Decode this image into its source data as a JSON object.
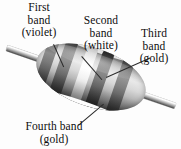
{
  "figure": {
    "background_color": "#fdfdfd",
    "text_color": "#0d0d0d"
  },
  "labels": {
    "first": {
      "line1": "First",
      "line2": "band",
      "line3": "(violet)"
    },
    "second": {
      "line1": "Second",
      "line2": "band",
      "line3": "(white)"
    },
    "third": {
      "line1": "Third",
      "line2": "band",
      "line3": "(gold)"
    },
    "fourth": {
      "line1": "Fourth band",
      "line2": "(gold)"
    }
  },
  "resistor": {
    "body_color": "#cfcfcf",
    "lead_color": "#bdbdbd",
    "bands": [
      {
        "name": "first-band",
        "color_name": "violet",
        "swatch": "#2b2b2b"
      },
      {
        "name": "second-band",
        "color_name": "white",
        "swatch": "#ffffff"
      },
      {
        "name": "third-band",
        "color_name": "gold",
        "swatch": "#3a3a3a"
      },
      {
        "name": "fourth-band",
        "color_name": "gold",
        "swatch": "#3a3a3a"
      }
    ]
  },
  "leaders": {
    "first": "leader-line-first-band",
    "second": "leader-line-second-band",
    "third": "leader-line-third-band",
    "fourth": "leader-line-fourth-band"
  }
}
